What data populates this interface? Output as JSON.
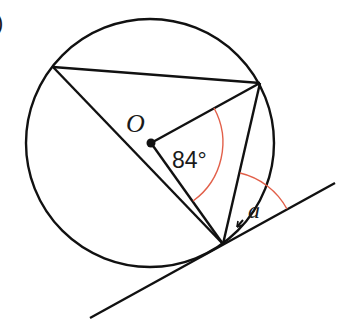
{
  "diagram": {
    "type": "circle-theorem",
    "labels": {
      "centre": "O",
      "central_angle": "84°",
      "unknown_angle": "a",
      "part_marker": ")"
    },
    "colors": {
      "stroke": "#111111",
      "angle_arc": "#e2604a",
      "background": "#ffffff"
    },
    "circle": {
      "cx": 150,
      "cy": 143,
      "r": 124
    },
    "points": {
      "O": [
        151,
        143
      ],
      "A": [
        53,
        67
      ],
      "B": [
        260,
        83
      ],
      "T": [
        223,
        244
      ]
    },
    "tangent": {
      "from": [
        90,
        318
      ],
      "to": [
        335,
        183
      ]
    },
    "values": {
      "central_angle_deg": 84,
      "unknown_angle": "a"
    }
  }
}
